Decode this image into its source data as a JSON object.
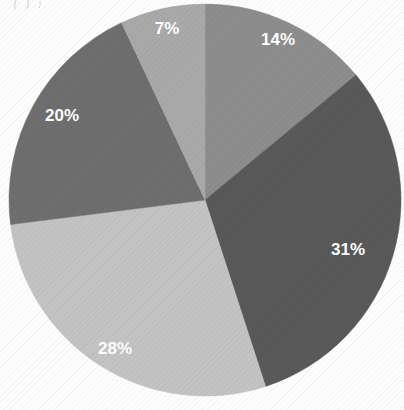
{
  "chart_data": {
    "type": "pie",
    "title": "",
    "subtitle": "",
    "xlabel": "",
    "ylabel": "",
    "legend_position": "none",
    "grid": false,
    "start_angle_deg": 0,
    "direction": "clockwise",
    "units": "percent",
    "total": 100,
    "categories": [
      "14%",
      "31%",
      "28%",
      "20%",
      "7%"
    ],
    "values": [
      14,
      31,
      28,
      20,
      7
    ],
    "labels": [
      "14%",
      "31%",
      "28%",
      "20%",
      "7%"
    ],
    "colors": [
      "#8d8d8d",
      "#595959",
      "#c3c3c3",
      "#6e6e6e",
      "#a9a9a9"
    ],
    "slices": [
      {
        "label": "14%",
        "value": 14,
        "color": "#8d8d8d",
        "start_deg": 0,
        "end_deg": 50.4,
        "label_x": 278,
        "label_y": 41
      },
      {
        "label": "31%",
        "value": 31,
        "color": "#595959",
        "start_deg": 50.4,
        "end_deg": 162.0,
        "label_x": 348,
        "label_y": 251
      },
      {
        "label": "28%",
        "value": 28,
        "color": "#c3c3c3",
        "start_deg": 162.0,
        "end_deg": 262.8,
        "label_x": 115,
        "label_y": 350
      },
      {
        "label": "20%",
        "value": 20,
        "color": "#6e6e6e",
        "start_deg": 262.8,
        "end_deg": 334.8,
        "label_x": 62,
        "label_y": 117
      },
      {
        "label": "7%",
        "value": 7,
        "color": "#a9a9a9",
        "start_deg": 334.8,
        "end_deg": 360.0,
        "label_x": 167,
        "label_y": 30
      }
    ],
    "geometry": {
      "center_x": 205,
      "center_y": 200,
      "radius": 196
    },
    "background_color": "#fdfdfd"
  }
}
